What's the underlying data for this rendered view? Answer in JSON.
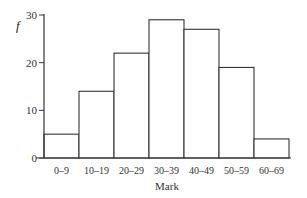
{
  "chart_data": {
    "type": "bar",
    "title": "",
    "xlabel": "Mark",
    "ylabel": "f",
    "categories": [
      "0–9",
      "10–19",
      "20–29",
      "30–39",
      "40–49",
      "50–59",
      "60–69"
    ],
    "values": [
      5,
      14,
      22,
      29,
      27,
      19,
      4
    ],
    "ylim": [
      0,
      30
    ],
    "yticks": [
      0,
      10,
      20,
      30
    ],
    "grid": false,
    "legend": null,
    "style": "histogram"
  }
}
